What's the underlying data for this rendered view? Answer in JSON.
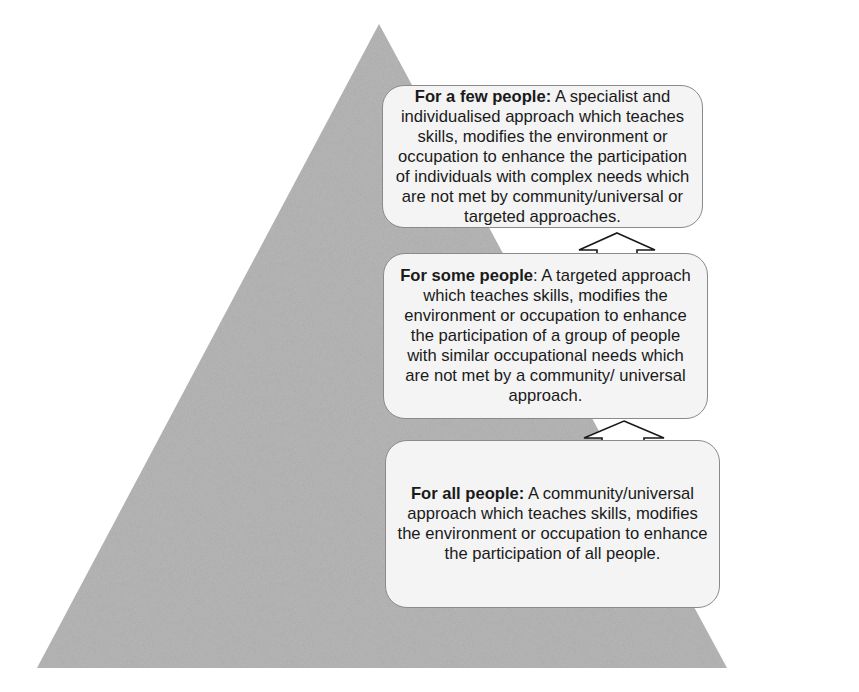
{
  "diagram": {
    "type": "pyramid",
    "colors": {
      "pyramid_fill": "#a9a9a9",
      "box_fill": "#f4f4f4",
      "box_border": "#8a8a8a",
      "text": "#1a1a1a",
      "arrow_fill": "#ffffff",
      "arrow_stroke": "#1a1a1a"
    },
    "tiers": [
      {
        "level": "top",
        "heading": "For a few people:",
        "body": " A specialist and individualised approach which teaches skills, modifies the environment or occupation to enhance the participation of individuals with complex needs which are not met by community/universal or targeted approaches."
      },
      {
        "level": "middle",
        "heading": "For some people",
        "body": ": A targeted approach which teaches skills, modifies the environment or occupation to enhance the participation of a group of people with similar occupational needs which are not met by a community/ universal approach."
      },
      {
        "level": "bottom",
        "heading": "For all people:",
        "body": " A community/universal approach which teaches skills, modifies the environment or occupation to enhance the participation of all people."
      }
    ],
    "arrows": [
      {
        "from": "middle",
        "to": "top",
        "icon": "up-arrow-icon"
      },
      {
        "from": "bottom",
        "to": "middle",
        "icon": "up-arrow-icon"
      }
    ]
  }
}
